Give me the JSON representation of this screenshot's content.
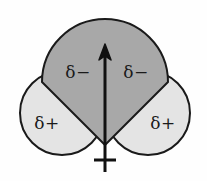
{
  "figure": {
    "background_color": "#fefefe",
    "outline_color": "#1a1a1a"
  },
  "lobes": {
    "oxygen": {
      "name": "oxygen-lobe",
      "fill_color": "#a8a8a8",
      "labels": [
        {
          "text": "δ−",
          "x": 78,
          "y": 73
        },
        {
          "text": "δ−",
          "x": 136,
          "y": 73
        }
      ]
    },
    "hydrogen_left": {
      "name": "hydrogen-lobe-left",
      "fill_color": "#e4e4e4",
      "label": {
        "text": "δ+",
        "x": 47,
        "y": 124
      }
    },
    "hydrogen_right": {
      "name": "hydrogen-lobe-right",
      "fill_color": "#e4e4e4",
      "label": {
        "text": "δ+",
        "x": 163,
        "y": 124
      }
    }
  },
  "dipole_arrow": {
    "name": "net-dipole-arrow",
    "color": "#111111",
    "tip_y": 45,
    "tail_y": 172,
    "x": 105,
    "crossbar_y": 160,
    "crossbar_half_width": 11
  }
}
